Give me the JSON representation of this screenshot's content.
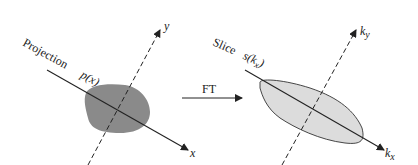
{
  "left_panel": {
    "projection_label": "Projection",
    "projection_func": "p(x)",
    "x_axis": "x",
    "y_axis": "y",
    "object_color": "#8a8a8a"
  },
  "arrow": {
    "label": "FT"
  },
  "right_panel": {
    "slice_label": "Slice",
    "slice_func": "s(k",
    "slice_sub": "x",
    "slice_close": ")",
    "kx_axis": "k",
    "kx_sub": "x",
    "ky_axis": "k",
    "ky_sub": "y",
    "object_color": "#dcdcdc"
  }
}
